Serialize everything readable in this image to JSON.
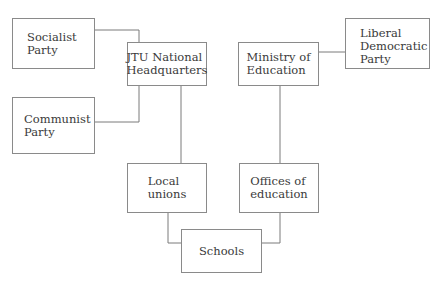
{
  "diagram": {
    "type": "organizational-relationship-diagram",
    "nodes": {
      "socialist_party": "Socialist\nParty",
      "jtu_hq": "JTU National\nHeadquarters",
      "communist_party": "Communist\nParty",
      "ministry": "Ministry of\nEducation",
      "ldp": "Liberal\nDemocratic\nParty",
      "local_unions": "Local\nunions",
      "offices": "Offices of\neducation",
      "schools": "Schools"
    },
    "edges": [
      [
        "socialist_party",
        "jtu_hq"
      ],
      [
        "communist_party",
        "jtu_hq"
      ],
      [
        "ldp",
        "ministry"
      ],
      [
        "jtu_hq",
        "local_unions"
      ],
      [
        "ministry",
        "offices"
      ],
      [
        "local_unions",
        "schools"
      ],
      [
        "offices",
        "schools"
      ]
    ]
  }
}
